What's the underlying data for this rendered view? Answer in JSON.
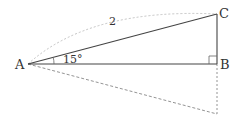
{
  "diagram": {
    "points": {
      "A": {
        "label": "A",
        "x": 28,
        "y": 64
      },
      "B": {
        "label": "B",
        "x": 217,
        "y": 64
      },
      "C": {
        "label": "C",
        "x": 217,
        "y": 14
      },
      "D": {
        "x": 217,
        "y": 114
      }
    },
    "angle_label": "15°",
    "length_label": "2",
    "colors": {
      "solid": "#444444",
      "dashed": "#888888",
      "arc": "#bbbbbb"
    }
  }
}
